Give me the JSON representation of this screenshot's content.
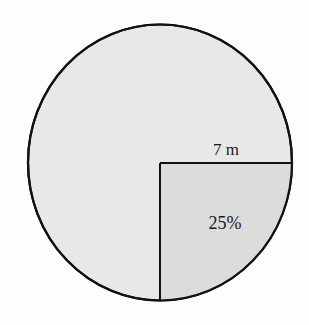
{
  "diagram": {
    "type": "circle-with-quadrant",
    "shape": "circle",
    "shaded_sector": {
      "label": "25%",
      "fraction": 0.25,
      "position": "lower-right quadrant"
    },
    "radius_label": "7 m",
    "colors": {
      "circle_fill": "#e8e8e8",
      "quadrant_fill": "#dddddd",
      "stroke": "#111111",
      "background": "#fdfdfd"
    }
  }
}
